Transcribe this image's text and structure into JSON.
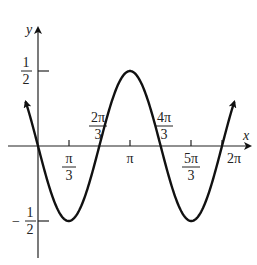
{
  "figure": {
    "function": "y = -1/2 sin(3x/2)",
    "axes": {
      "x_label": "x",
      "y_label": "y"
    },
    "x_ticks": [
      {
        "num": "π",
        "den": "3",
        "value": 1.0472
      },
      {
        "num": "2π",
        "den": "3",
        "value": 2.0944
      },
      {
        "num": "π",
        "den": "",
        "value": 3.1416
      },
      {
        "num": "4π",
        "den": "3",
        "value": 4.1888
      },
      {
        "num": "5π",
        "den": "3",
        "value": 5.236
      },
      {
        "num": "2π",
        "den": "",
        "value": 6.2832
      }
    ],
    "y_ticks": [
      {
        "sign": "",
        "num": "1",
        "den": "2",
        "value": 0.5
      },
      {
        "sign": "−",
        "num": "1",
        "den": "2",
        "value": -0.5
      }
    ],
    "colors": {
      "curve": "#111111",
      "axis": "#222222",
      "background": "#ffffff"
    }
  }
}
